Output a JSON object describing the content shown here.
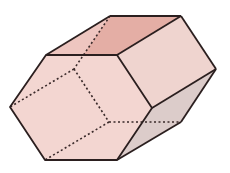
{
  "figure": {
    "view": "oblique 3D view with hidden edges dashed",
    "front_hexagon": [
      [
        46,
        55
      ],
      [
        117,
        55
      ],
      [
        152,
        108
      ],
      [
        117,
        160
      ],
      [
        45,
        160
      ],
      [
        10,
        107
      ]
    ],
    "back_hexagon": [
      [
        110,
        16
      ],
      [
        181,
        16
      ],
      [
        216,
        69
      ],
      [
        181,
        122
      ],
      [
        109,
        122
      ],
      [
        74,
        69
      ]
    ],
    "colors": {
      "front_face": "#f3d6d1",
      "top_face": "#e4aea5",
      "upper_right_face": "#efd4cf",
      "lower_right_face": "#dcccca",
      "edge": "#2b1f1f",
      "hidden_edge": "#3a2a2a",
      "background": "#ffffff"
    }
  }
}
